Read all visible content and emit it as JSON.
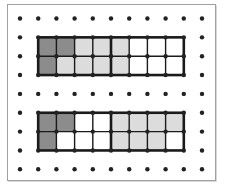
{
  "diagram": {
    "title": "",
    "grid": {
      "columns": 11,
      "rows": 9,
      "x0": 20,
      "y0": 18.5,
      "dx": 18.2,
      "dy": 18.85,
      "dot_color": "#222222"
    },
    "colors": {
      "dark": "#8c8c8c",
      "light": "#dcdcdc",
      "white": "#ffffff",
      "line": "#1a1a1a"
    },
    "rectangles": [
      {
        "name": "top-rectangle",
        "col_start": 1,
        "row_start": 1,
        "cols": 8,
        "rows": 2,
        "thick_divider_after_col": 4,
        "cells": [
          [
            "dark",
            "dark",
            "light",
            "light",
            "light",
            "white",
            "white",
            "white"
          ],
          [
            "dark",
            "light",
            "light",
            "light",
            "light",
            "white",
            "white",
            "white"
          ]
        ]
      },
      {
        "name": "bottom-rectangle",
        "col_start": 1,
        "row_start": 5,
        "cols": 8,
        "rows": 2,
        "thick_divider_after_col": 4,
        "cells": [
          [
            "dark",
            "dark",
            "white",
            "white",
            "light",
            "light",
            "light",
            "light"
          ],
          [
            "dark",
            "white",
            "white",
            "white",
            "light",
            "light",
            "light",
            "white"
          ]
        ]
      }
    ]
  }
}
